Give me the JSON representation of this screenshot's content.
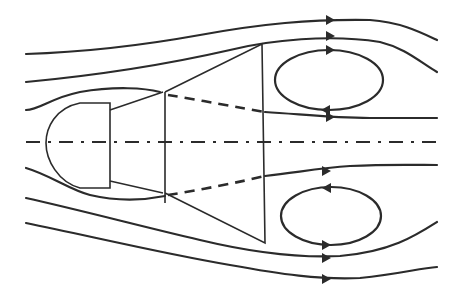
{
  "diagram": {
    "title": "",
    "colors": {
      "line": "#2b2b2b",
      "background": "#ffffff"
    },
    "elements": {
      "body": [
        "hemispherical-nose",
        "cylindrical-section",
        "small-frustum",
        "large-frustum"
      ],
      "streamlines_upper": 3,
      "streamlines_lower": 3,
      "recirculation_zones": [
        "upper-vortex",
        "lower-vortex"
      ],
      "dashed_lines": [
        "upper-shear-layer",
        "lower-shear-layer"
      ],
      "centerline": "dash-dot symmetry axis"
    },
    "labels": []
  }
}
